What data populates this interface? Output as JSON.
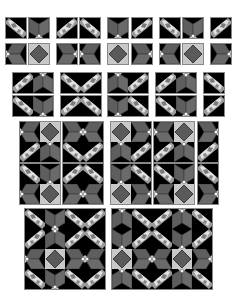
{
  "colors": {
    "background": "#ffffff",
    "tile_black": "#000000",
    "tile_dark_grey": "#5a5a5a",
    "tile_mid_grey": "#6e6e6e",
    "tile_light_grey": "#c8c8c8",
    "gem_light": "#e6e6e6",
    "border": "#8a8a8a"
  },
  "tile_types": {
    "G1": "gem-diagonal-tl-br",
    "G2": "gem-diagonal-tr-bl",
    "V": "chevron-down",
    "VU": "chevron-up",
    "R": "chevron-right",
    "L": "chevron-left",
    "D": "diamond"
  },
  "groups": [
    {
      "x": 5,
      "y": 17,
      "cols": 1,
      "tiles": [
        "G1"
      ]
    },
    {
      "x": 28,
      "y": 17,
      "cols": 1,
      "tiles": [
        "V"
      ]
    },
    {
      "x": 56,
      "y": 17,
      "cols": 1,
      "tiles": [
        "G2"
      ]
    },
    {
      "x": 79,
      "y": 17,
      "cols": 1,
      "tiles": [
        "G1"
      ]
    },
    {
      "x": 107,
      "y": 17,
      "cols": 1,
      "tiles": [
        "V"
      ]
    },
    {
      "x": 131,
      "y": 17,
      "cols": 1,
      "tiles": [
        "G2"
      ]
    },
    {
      "x": 159,
      "y": 17,
      "cols": 1,
      "tiles": [
        "G1"
      ]
    },
    {
      "x": 182,
      "y": 17,
      "cols": 1,
      "tiles": [
        "V"
      ]
    },
    {
      "x": 210,
      "y": 17,
      "cols": 1,
      "tiles": [
        "G2"
      ]
    },
    {
      "x": 5,
      "y": 43,
      "cols": 1,
      "tiles": [
        "L"
      ]
    },
    {
      "x": 28,
      "y": 43,
      "cols": 1,
      "tiles": [
        "D"
      ]
    },
    {
      "x": 56,
      "y": 43,
      "cols": 1,
      "tiles": [
        "R"
      ]
    },
    {
      "x": 79,
      "y": 43,
      "cols": 1,
      "tiles": [
        "L"
      ]
    },
    {
      "x": 107,
      "y": 43,
      "cols": 1,
      "tiles": [
        "D"
      ]
    },
    {
      "x": 131,
      "y": 43,
      "cols": 1,
      "tiles": [
        "R"
      ]
    },
    {
      "x": 159,
      "y": 43,
      "cols": 1,
      "tiles": [
        "L"
      ]
    },
    {
      "x": 182,
      "y": 43,
      "cols": 1,
      "tiles": [
        "D"
      ]
    },
    {
      "x": 210,
      "y": 43,
      "cols": 1,
      "tiles": [
        "R"
      ]
    },
    {
      "x": 12,
      "y": 72,
      "cols": 2,
      "tiles": [
        "G2",
        "VU"
      ]
    },
    {
      "x": 60,
      "y": 72,
      "cols": 2,
      "tiles": [
        "G1",
        "G2"
      ]
    },
    {
      "x": 107,
      "y": 72,
      "cols": 2,
      "tiles": [
        "VU",
        "G2"
      ]
    },
    {
      "x": 155,
      "y": 72,
      "cols": 2,
      "tiles": [
        "G2",
        "VU"
      ]
    },
    {
      "x": 203,
      "y": 72,
      "cols": 1,
      "tiles": [
        "G1"
      ]
    },
    {
      "x": 12,
      "y": 95,
      "cols": 2,
      "tiles": [
        "G1",
        "V"
      ]
    },
    {
      "x": 60,
      "y": 95,
      "cols": 2,
      "tiles": [
        "G2",
        "G1"
      ]
    },
    {
      "x": 107,
      "y": 95,
      "cols": 2,
      "tiles": [
        "V",
        "G1"
      ]
    },
    {
      "x": 155,
      "y": 95,
      "cols": 2,
      "tiles": [
        "G1",
        "V"
      ]
    },
    {
      "x": 203,
      "y": 95,
      "cols": 1,
      "tiles": [
        "G2"
      ]
    },
    {
      "x": 19,
      "y": 121,
      "cols": 2,
      "tiles": [
        "L",
        "D",
        "G2",
        "VU"
      ]
    },
    {
      "x": 62,
      "y": 121,
      "cols": 2,
      "tiles": [
        "R",
        "L",
        "G1",
        "G2"
      ]
    },
    {
      "x": 110,
      "y": 121,
      "cols": 2,
      "tiles": [
        "D",
        "R",
        "VU",
        "G2"
      ]
    },
    {
      "x": 153,
      "y": 121,
      "cols": 2,
      "tiles": [
        "L",
        "D",
        "G2",
        "VU"
      ]
    },
    {
      "x": 197,
      "y": 121,
      "cols": 1,
      "tiles": [
        "R",
        "G2"
      ]
    },
    {
      "x": 19,
      "y": 163,
      "cols": 2,
      "tiles": [
        "G1",
        "V",
        "L",
        "D"
      ]
    },
    {
      "x": 62,
      "y": 163,
      "cols": 2,
      "tiles": [
        "G2",
        "G1",
        "R",
        "L"
      ]
    },
    {
      "x": 110,
      "y": 163,
      "cols": 2,
      "tiles": [
        "V",
        "G1",
        "D",
        "R"
      ]
    },
    {
      "x": 153,
      "y": 163,
      "cols": 2,
      "tiles": [
        "G1",
        "V",
        "L",
        "D"
      ]
    },
    {
      "x": 197,
      "y": 163,
      "cols": 1,
      "tiles": [
        "G1",
        "R"
      ]
    },
    {
      "x": 24,
      "y": 208,
      "cols": 4,
      "tiles": [
        "G1",
        "V",
        "G1",
        "G2",
        "G2",
        "VU",
        "G2",
        "G1",
        "L",
        "D",
        "R",
        "L",
        "G1",
        "V",
        "G1",
        "G2"
      ]
    },
    {
      "x": 111,
      "y": 208,
      "cols": 5,
      "tiles": [
        "VU",
        "G1",
        "G2",
        "VU",
        "G1",
        "V",
        "G2",
        "G1",
        "V",
        "G2",
        "D",
        "R",
        "L",
        "D",
        "R",
        "VU",
        "G1",
        "G2",
        "VU",
        "G1"
      ]
    }
  ]
}
